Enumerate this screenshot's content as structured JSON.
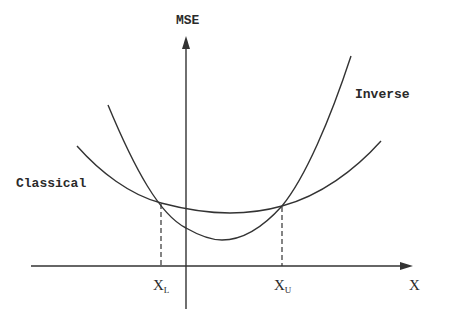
{
  "diagram": {
    "y_axis_label": "MSE",
    "x_axis_label": "X",
    "curves": [
      {
        "name": "Inverse",
        "label": "Inverse",
        "description": "steeper parabola with lower minimum"
      },
      {
        "name": "Classical",
        "label": "Classical",
        "description": "flatter parabola with higher minimum"
      }
    ],
    "markers": [
      {
        "symbol": "X",
        "subscript": "L",
        "meaning": "lower crossing point"
      },
      {
        "symbol": "X",
        "subscript": "U",
        "meaning": "upper crossing point"
      }
    ],
    "colors": {
      "stroke": "#333333",
      "background": "#ffffff"
    }
  }
}
